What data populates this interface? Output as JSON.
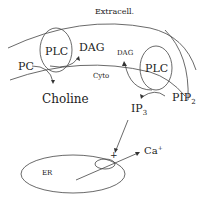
{
  "diagram": {
    "labels": {
      "extracell": "Extracell.",
      "cyto": "Cyto",
      "plc_left": "PLC",
      "plc_right": "PLC",
      "dag_left": "DAG",
      "dag_right": "DAG",
      "pc": "PC",
      "choline": "Choline",
      "pip2": "PIP",
      "pip2_sub": "2",
      "ip3": "IP",
      "ip3_sub": "3",
      "plus": "+",
      "ca": "Ca",
      "ca_sup": "+",
      "er": "ER"
    },
    "colors": {
      "line": "#444444",
      "text": "#222222"
    }
  }
}
